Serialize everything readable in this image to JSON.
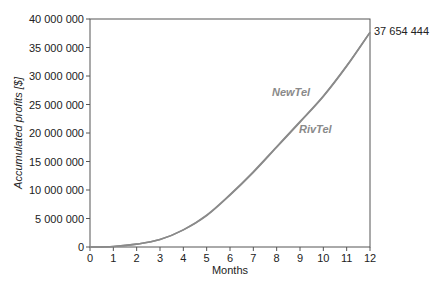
{
  "chart_data": {
    "type": "line",
    "title": "",
    "xlabel": "Months",
    "ylabel": "Accumulated profits [$]",
    "xlim": [
      0,
      12
    ],
    "ylim": [
      0,
      40000000
    ],
    "x_ticks": [
      "0",
      "1",
      "2",
      "3",
      "4",
      "5",
      "6",
      "7",
      "8",
      "9",
      "10",
      "11",
      "12"
    ],
    "y_ticks": [
      "0",
      "5 000 000",
      "10 000 000",
      "15 000 000",
      "20 000 000",
      "25 000 000",
      "30 000 000",
      "35 000 000",
      "40 000 000"
    ],
    "y_tick_values": [
      0,
      5000000,
      10000000,
      15000000,
      20000000,
      25000000,
      30000000,
      35000000,
      40000000
    ],
    "grid": false,
    "legend": "inline labels",
    "x": [
      0,
      1,
      2,
      3,
      4,
      5,
      6,
      7,
      8,
      9,
      10,
      11,
      12
    ],
    "series": [
      {
        "name": "NewTel",
        "color": "#8a8a8a",
        "values": [
          0,
          100000,
          500000,
          1300000,
          3000000,
          5600000,
          9200000,
          13200000,
          17600000,
          22000000,
          26500000,
          31800000,
          37654444
        ]
      },
      {
        "name": "RivTel",
        "color": "#8a8a8a",
        "values": [
          0,
          100000,
          500000,
          1300000,
          3000000,
          5500000,
          9100000,
          13100000,
          17500000,
          21900000,
          26400000,
          31700000,
          37654444
        ]
      }
    ],
    "annotations": [
      {
        "text": "NewTel",
        "x": 8.6,
        "y": 27000000
      },
      {
        "text": "RivTel",
        "x": 9.7,
        "y": 21000000
      },
      {
        "text": "37 654 444",
        "x": 12,
        "y": 37654444
      }
    ]
  },
  "labels": {
    "xlabel": "Months",
    "ylabel": "Accumulated profits [$]",
    "newtel": "NewTel",
    "rivtel": "RivTel",
    "end_value": "37 654 444"
  }
}
